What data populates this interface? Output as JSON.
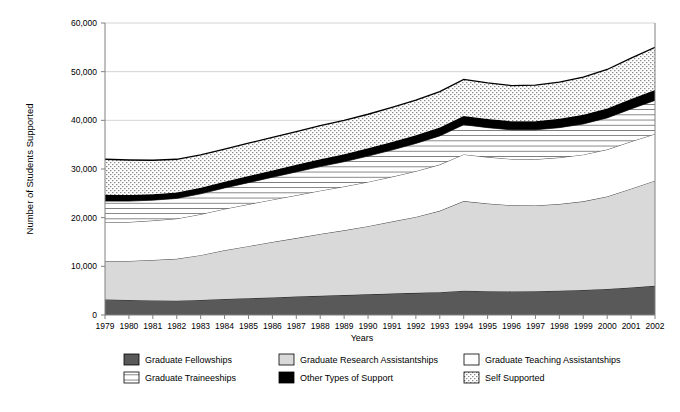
{
  "chart_data": {
    "type": "area",
    "stacked": true,
    "title": "",
    "xlabel": "Years",
    "ylabel": "Number of Students Supported",
    "ylim": [
      0,
      60000
    ],
    "ytick_labels": [
      "0",
      "10,000",
      "20,000",
      "30,000",
      "40,000",
      "50,000",
      "60,000"
    ],
    "yticks": [
      0,
      10000,
      20000,
      30000,
      40000,
      50000,
      60000
    ],
    "grid": true,
    "grid_axis": "y",
    "legend_position": "bottom",
    "categories": [
      1979,
      1980,
      1981,
      1982,
      1983,
      1984,
      1985,
      1986,
      1987,
      1988,
      1989,
      1990,
      1991,
      1992,
      1993,
      1994,
      1995,
      1996,
      1997,
      1998,
      1999,
      2000,
      2001,
      2002
    ],
    "x": [
      "1979",
      "1980",
      "1981",
      "1982",
      "1983",
      "1984",
      "1985",
      "1986",
      "1987",
      "1988",
      "1989",
      "1990",
      "1991",
      "1992",
      "1993",
      "1994",
      "1995",
      "1996",
      "1997",
      "1998",
      "1999",
      "2000",
      "2001",
      "2002"
    ],
    "series": [
      {
        "name": "Graduate Fellowships",
        "fill": "#595959",
        "pattern": "solid",
        "values": [
          3200,
          3100,
          3000,
          2950,
          3100,
          3300,
          3450,
          3600,
          3800,
          3950,
          4100,
          4250,
          4400,
          4550,
          4700,
          5000,
          4900,
          4850,
          4900,
          5000,
          5150,
          5350,
          5650,
          6000
        ]
      },
      {
        "name": "Graduate Research Assistantships",
        "fill": "#d9d9d9",
        "pattern": "solid",
        "values": [
          7900,
          8000,
          8300,
          8600,
          9200,
          10000,
          10700,
          11400,
          12000,
          12700,
          13300,
          14000,
          14800,
          15600,
          16700,
          18400,
          18000,
          17700,
          17600,
          17800,
          18200,
          19000,
          20300,
          21600
        ]
      },
      {
        "name": "Graduate Teaching Assistantships",
        "fill": "#ffffff",
        "pattern": "none",
        "values": [
          7900,
          8000,
          8100,
          8250,
          8400,
          8500,
          8600,
          8700,
          8800,
          8900,
          9000,
          9100,
          9200,
          9400,
          9500,
          9600,
          9550,
          9500,
          9500,
          9550,
          9600,
          9650,
          9700,
          9600
        ]
      },
      {
        "name": "Graduate Traineeships",
        "fill": "#ffffff",
        "pattern": "horizontal-lines",
        "values": [
          4400,
          4300,
          4200,
          4150,
          4200,
          4300,
          4450,
          4600,
          4800,
          4950,
          5100,
          5300,
          5500,
          5700,
          5900,
          6100,
          6050,
          6000,
          6050,
          6150,
          6300,
          6500,
          6700,
          6900
        ]
      },
      {
        "name": "Other Types of Support",
        "fill": "#000000",
        "pattern": "solid",
        "values": [
          1300,
          1250,
          1200,
          1200,
          1250,
          1300,
          1350,
          1400,
          1450,
          1500,
          1550,
          1600,
          1650,
          1700,
          1750,
          1800,
          1780,
          1760,
          1780,
          1820,
          1880,
          1950,
          2050,
          2150
        ]
      },
      {
        "name": "Self Supported",
        "fill": "#ffffff",
        "pattern": "dots",
        "values": [
          7300,
          7200,
          7000,
          6850,
          6750,
          6700,
          6750,
          6800,
          6850,
          6900,
          6950,
          7000,
          7100,
          7200,
          7350,
          7500,
          7420,
          7340,
          7400,
          7550,
          7750,
          8000,
          8400,
          8750
        ]
      }
    ],
    "totals": [
      32000,
      31850,
      31800,
      32000,
      32900,
      34100,
      35300,
      36500,
      37700,
      38900,
      40000,
      41250,
      42650,
      44150,
      45900,
      48400,
      47700,
      47150,
      47230,
      47870,
      48880,
      50450,
      52800,
      55000
    ]
  },
  "axes": {
    "y_axis_title": "Number of Students Supported",
    "x_axis_title": "Years"
  },
  "legend": {
    "items": [
      {
        "label": "Graduate Fellowships",
        "swatch": "solid-dark-gray-swatch"
      },
      {
        "label": "Graduate Research Assistantships",
        "swatch": "solid-light-gray-swatch"
      },
      {
        "label": "Graduate Teaching Assistantships",
        "swatch": "empty-white-swatch"
      },
      {
        "label": "Graduate Traineeships",
        "swatch": "horizontal-lines-swatch"
      },
      {
        "label": "Other Types of Support",
        "swatch": "solid-black-swatch"
      },
      {
        "label": "Self Supported",
        "swatch": "dotted-swatch"
      }
    ]
  },
  "colors": {
    "fellowships": "#595959",
    "research_assistantships": "#d9d9d9",
    "teaching_assistantships": "#ffffff",
    "traineeships": "#ffffff",
    "other_support": "#000000",
    "self_supported": "#ffffff",
    "grid": "#c8c8c8",
    "axis": "#808080",
    "outline": "#000000"
  }
}
